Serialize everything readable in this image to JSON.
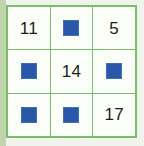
{
  "figure": {
    "name": "number-square-grid",
    "rows": 3,
    "columns": 3,
    "grid_line_color": "#7cbd6b",
    "cell_background_color": "#fbfdf8",
    "number_text_color": "#1c1c1c",
    "square_color": "#2a57a8",
    "page_background_color": "#f1f3ed"
  },
  "cells": [
    {
      "row": 1,
      "col": 1,
      "type": "number",
      "value": "11",
      "icon": ""
    },
    {
      "row": 1,
      "col": 2,
      "type": "square",
      "value": "",
      "icon": "blue-square-icon"
    },
    {
      "row": 1,
      "col": 3,
      "type": "number",
      "value": "5",
      "icon": ""
    },
    {
      "row": 2,
      "col": 1,
      "type": "square",
      "value": "",
      "icon": "blue-square-icon"
    },
    {
      "row": 2,
      "col": 2,
      "type": "number",
      "value": "14",
      "icon": ""
    },
    {
      "row": 2,
      "col": 3,
      "type": "square",
      "value": "",
      "icon": "blue-square-icon"
    },
    {
      "row": 3,
      "col": 1,
      "type": "square",
      "value": "",
      "icon": "blue-square-icon"
    },
    {
      "row": 3,
      "col": 2,
      "type": "square",
      "value": "",
      "icon": "blue-square-icon"
    },
    {
      "row": 3,
      "col": 3,
      "type": "number",
      "value": "17",
      "icon": ""
    }
  ]
}
